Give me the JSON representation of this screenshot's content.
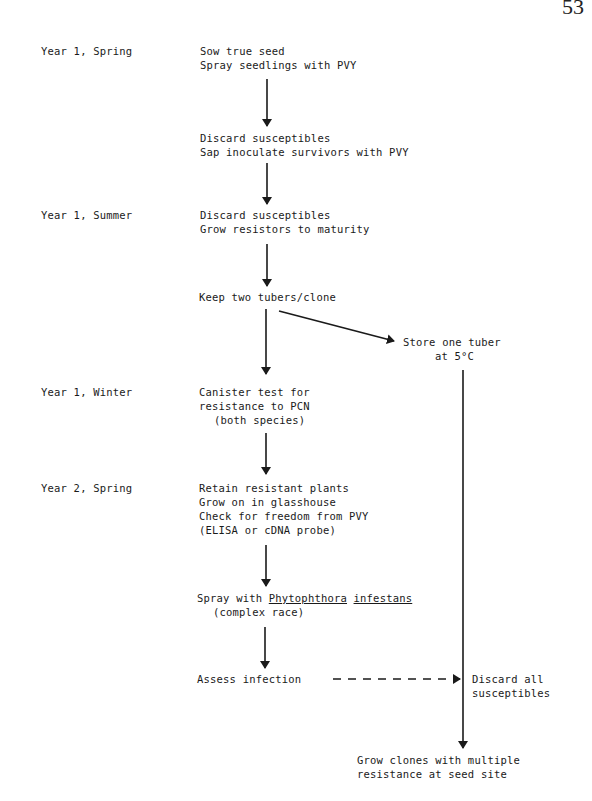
{
  "page_number": "53",
  "timeline": [
    {
      "id": "y1-spring",
      "label": "Year 1, Spring"
    },
    {
      "id": "y1-summer",
      "label": "Year 1, Summer"
    },
    {
      "id": "y1-winter",
      "label": "Year 1, Winter"
    },
    {
      "id": "y2-spring",
      "label": "Year 2, Spring"
    }
  ],
  "steps": {
    "sow": [
      "Sow true seed",
      "Spray seedlings with PVY"
    ],
    "discard1": [
      "Discard susceptibles",
      "Sap inoculate survivors with PVY"
    ],
    "discard2": [
      "Discard susceptibles",
      "Grow resistors to maturity"
    ],
    "keep": [
      "Keep two tubers/clone"
    ],
    "store": [
      "Store one tuber",
      "at 5°C"
    ],
    "canister": [
      "Canister test for",
      "resistance to PCN",
      "(both species)"
    ],
    "retain": [
      "Retain resistant plants",
      "Grow on in glasshouse",
      "Check for freedom from PVY",
      "(ELISA or cDNA probe)"
    ],
    "spray": {
      "prefix": "Spray with ",
      "genus": "Phytophthora",
      "space": " ",
      "species": "infestans",
      "line2": "(complex race)"
    },
    "assess": [
      "Assess infection"
    ],
    "discard_all": [
      "Discard all",
      "susceptibles"
    ],
    "final": [
      "Grow clones with multiple",
      "resistance at seed site"
    ]
  },
  "colors": {
    "ink": "#1a1a1a",
    "background": "#ffffff"
  }
}
